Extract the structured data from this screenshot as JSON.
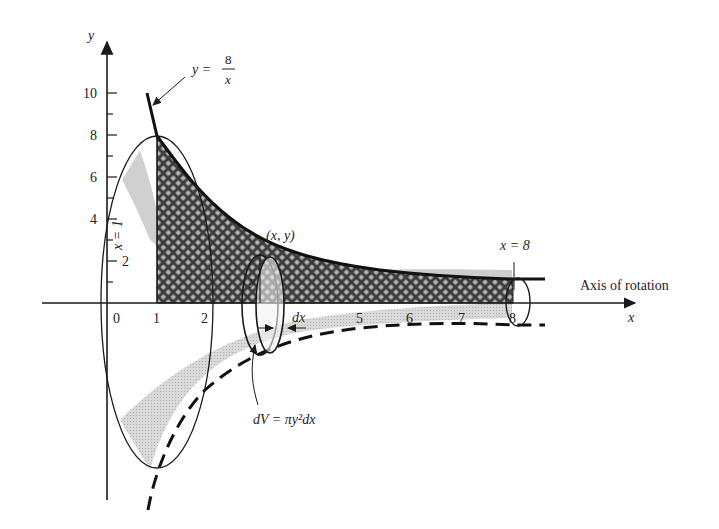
{
  "figure": {
    "type": "solid-of-revolution",
    "curve_label": {
      "lhs": "y =",
      "num": "8",
      "den": "x"
    },
    "x_axis": {
      "label": "x",
      "ticks": [
        "0",
        "1",
        "2",
        "5",
        "6",
        "7",
        "8"
      ]
    },
    "y_axis": {
      "label": "y",
      "ticks": [
        "2",
        "4",
        "6",
        "8",
        "10"
      ]
    },
    "left_bound_label": "x = 1",
    "right_bound_label": "x = 8",
    "point_label": "(x, y)",
    "radius_label": "y",
    "thickness_label": "dx",
    "volume_element_label": "dV = πy²dx",
    "rotation_axis_label": "Axis of rotation"
  },
  "colors": {
    "ink": "#1a1a1a",
    "shade": "#cfcfcf",
    "hatch_bg": "#555555"
  }
}
